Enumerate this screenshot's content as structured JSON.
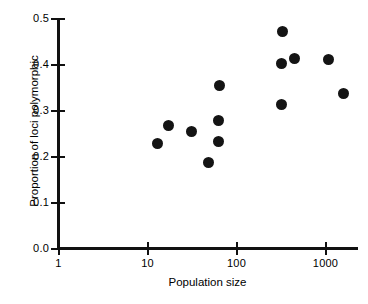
{
  "chart_data": {
    "type": "scatter",
    "title": "",
    "xlabel": "Population size",
    "ylabel": "Proportion of loci polymorphic",
    "xscale": "log",
    "yscale": "linear",
    "xlim": [
      1,
      2000
    ],
    "ylim": [
      0.0,
      0.5
    ],
    "grid": false,
    "legend": null,
    "x_tick_labels": [
      "1",
      "10",
      "100",
      "1000"
    ],
    "x_tick_values": [
      1,
      10,
      100,
      1000
    ],
    "y_tick_labels": [
      "0.0",
      "0.1",
      "0.2",
      "0.3",
      "0.4",
      "0.5"
    ],
    "y_tick_values": [
      0.0,
      0.1,
      0.2,
      0.3,
      0.4,
      0.5
    ],
    "marker": "filled-circle",
    "marker_color": "#141414",
    "points": [
      {
        "x": 13,
        "y": 0.228
      },
      {
        "x": 17,
        "y": 0.268
      },
      {
        "x": 31,
        "y": 0.255
      },
      {
        "x": 48,
        "y": 0.188
      },
      {
        "x": 62,
        "y": 0.278
      },
      {
        "x": 62,
        "y": 0.233
      },
      {
        "x": 65,
        "y": 0.355
      },
      {
        "x": 320,
        "y": 0.313
      },
      {
        "x": 320,
        "y": 0.402
      },
      {
        "x": 325,
        "y": 0.472
      },
      {
        "x": 450,
        "y": 0.413
      },
      {
        "x": 1080,
        "y": 0.412
      },
      {
        "x": 1600,
        "y": 0.338
      }
    ]
  },
  "caption": {
    "remnant": ""
  }
}
